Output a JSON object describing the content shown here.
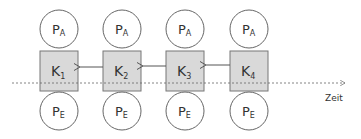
{
  "diagram": {
    "colors": {
      "box_fill": "#d9d9d9",
      "stroke": "#555555",
      "line": "#555555"
    },
    "axis_label": "Zeit",
    "columns": [
      {
        "top": {
          "main": "P",
          "sub": "A"
        },
        "box": {
          "main": "K",
          "sub": "1"
        },
        "bottom": {
          "main": "P",
          "sub": "E"
        }
      },
      {
        "top": {
          "main": "P",
          "sub": "A"
        },
        "box": {
          "main": "K",
          "sub": "2"
        },
        "bottom": {
          "main": "P",
          "sub": "E"
        }
      },
      {
        "top": {
          "main": "P",
          "sub": "A"
        },
        "box": {
          "main": "K",
          "sub": "3"
        },
        "bottom": {
          "main": "P",
          "sub": "E"
        }
      },
      {
        "top": {
          "main": "P",
          "sub": "A"
        },
        "box": {
          "main": "K",
          "sub": "4"
        },
        "bottom": {
          "main": "P",
          "sub": "E"
        }
      }
    ]
  }
}
